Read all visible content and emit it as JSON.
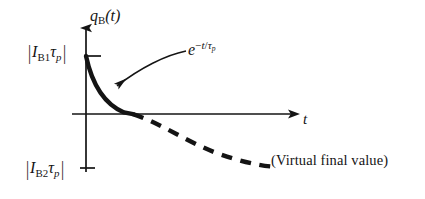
{
  "figure": {
    "domain": "diagram",
    "kind": "annotated-plot",
    "background_color": "#ffffff",
    "ink_color": "#141414"
  },
  "axes": {
    "y_axis": {
      "name": "q_B(t)",
      "label_main": "q",
      "label_sub": "B",
      "label_arg": "(t)",
      "arrow": "up",
      "x_px": 86,
      "top_px": 22,
      "bottom_px": 172
    },
    "x_axis": {
      "name": "t",
      "label_main": "t",
      "arrow": "right",
      "y_px": 114,
      "left_px": 72,
      "right_px": 300
    },
    "ticks": [
      {
        "id": "tick-upper",
        "side": "y",
        "y_px": 56,
        "label_main": "I",
        "label_sub": "B1",
        "label_tau": "τ",
        "label_tau_sub": "p",
        "label_text": "|I_B1 τ_p|",
        "meaning": "initial stored charge magnitude"
      },
      {
        "id": "tick-lower",
        "side": "y",
        "y_px": 168,
        "label_main": "I",
        "label_sub": "B2",
        "label_tau": "τ",
        "label_tau_sub": "p",
        "label_text": "|I_B2 τ_p|",
        "meaning": "virtual final charge magnitude"
      }
    ]
  },
  "curves": {
    "solid": {
      "name": "stored-charge-decay-solid",
      "style": "solid",
      "stroke_width": 4.2,
      "description": "exponential decay from upper tick value down through the time axis"
    },
    "dashed": {
      "name": "stored-charge-decay-dashed",
      "style": "dashed",
      "stroke_width": 4.2,
      "dash_pattern": "10 8",
      "description": "continuation of the exponential below the axis approaching the virtual final value"
    }
  },
  "annotations": {
    "exponential": {
      "text": "e^{-t/τ_p}",
      "base": "e",
      "exponent_minus": "−",
      "exponent_t": "t",
      "exponent_slash": "/",
      "exponent_tau": "τ",
      "exponent_tau_sub": "p",
      "leader_arrow": "curved-arrow-pointing-left-down-to-solid-curve"
    },
    "virtual_final_value": {
      "text": "(Virtual final value)"
    }
  }
}
